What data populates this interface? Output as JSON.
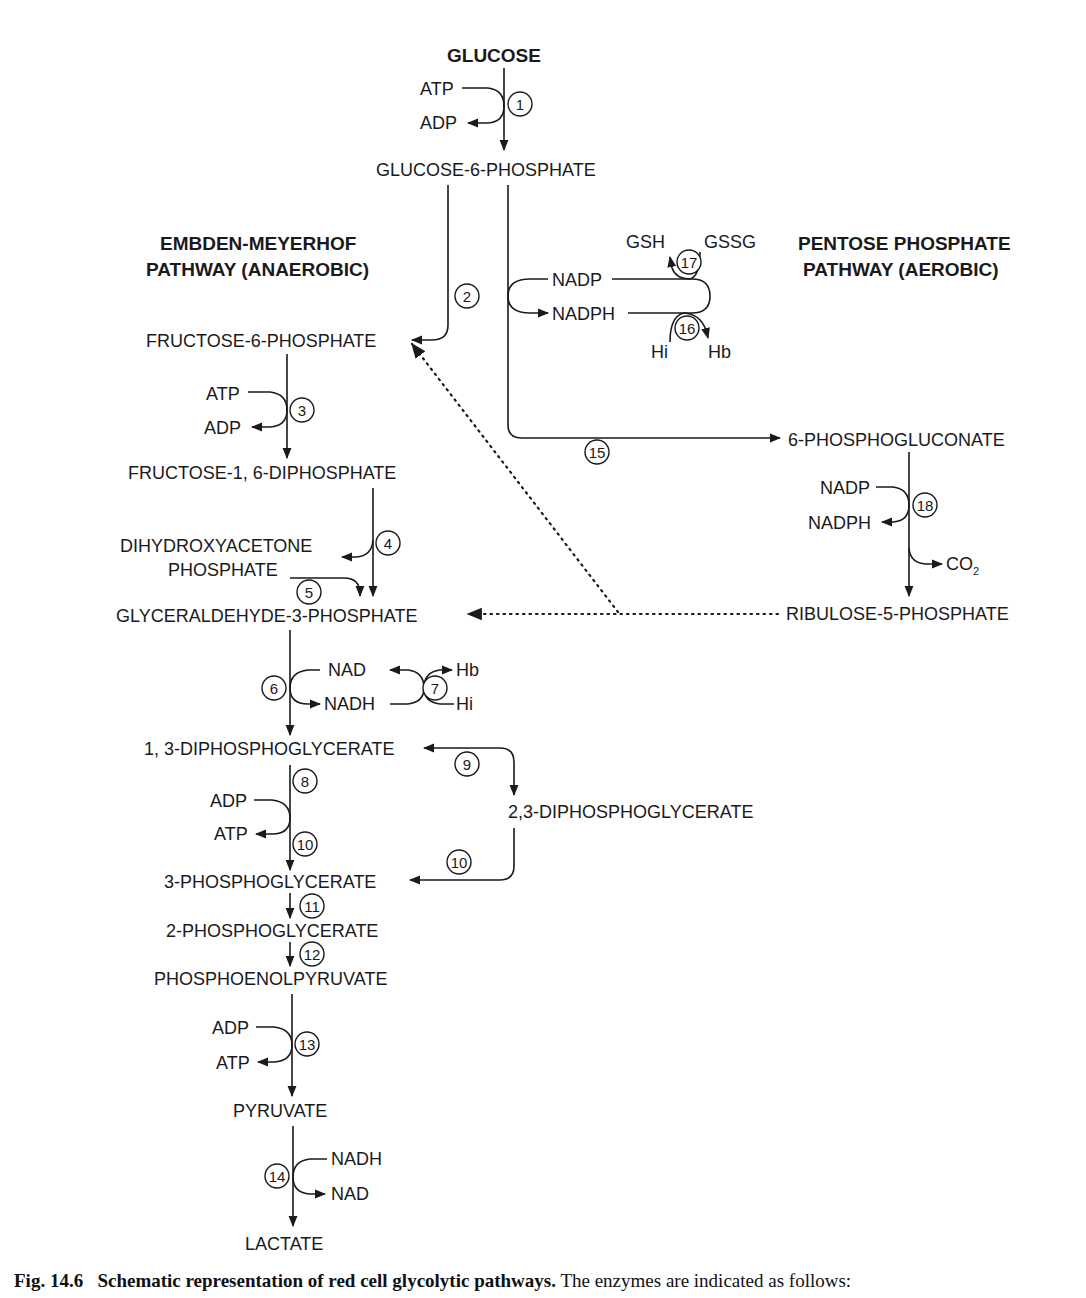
{
  "headings": {
    "glucose": "GLUCOSE",
    "emp_line1": "EMBDEN-MEYERHOF",
    "emp_line2": "PATHWAY (ANAEROBIC)",
    "ppp_line1": "PENTOSE PHOSPHATE",
    "ppp_line2": "PATHWAY (AEROBIC)"
  },
  "metabolites": {
    "g6p": "GLUCOSE-6-PHOSPHATE",
    "f6p": "FRUCTOSE-6-PHOSPHATE",
    "f16dp": "FRUCTOSE-1, 6-DIPHOSPHATE",
    "dhap1": "DIHYDROXYACETONE",
    "dhap2": "PHOSPHATE",
    "g3p": "GLYCERALDEHYDE-3-PHOSPHATE",
    "dpg13": "1, 3-DIPHOSPHOGLYCERATE",
    "dpg23": "2,3-DIPHOSPHOGLYCERATE",
    "pg3": "3-PHOSPHOGLYCERATE",
    "pg2": "2-PHOSPHOGLYCERATE",
    "pep": "PHOSPHOENOLPYRUVATE",
    "pyruvate": "PYRUVATE",
    "lactate": "LACTATE",
    "pgluconate": "6-PHOSPHOGLUCONATE",
    "ribulose": "RIBULOSE-5-PHOSPHATE"
  },
  "cofactors": {
    "atp1": "ATP",
    "adp1": "ADP",
    "atp3": "ATP",
    "adp3": "ADP",
    "nad6": "NAD",
    "nadh6": "NADH",
    "hb7": "Hb",
    "hi7": "Hi",
    "adp8": "ADP",
    "atp8": "ATP",
    "adp13": "ADP",
    "atp13": "ATP",
    "nadh14": "NADH",
    "nad14": "NAD",
    "gsh": "GSH",
    "gssg": "GSSG",
    "nadp_loop": "NADP",
    "nadph_loop": "NADPH",
    "hi16": "Hi",
    "hb16": "Hb",
    "nadp18": "NADP",
    "nadph18": "NADPH",
    "co2": "CO",
    "co2_sub": "2"
  },
  "enzymes": [
    "1",
    "2",
    "3",
    "4",
    "5",
    "6",
    "7",
    "8",
    "9",
    "10",
    "10",
    "11",
    "12",
    "13",
    "14",
    "15",
    "16",
    "17",
    "18"
  ],
  "caption": {
    "label": "Fig. 14.6",
    "title": "Schematic representation of red cell glycolytic pathways.",
    "text": "The enzymes are indicated as follows:"
  }
}
